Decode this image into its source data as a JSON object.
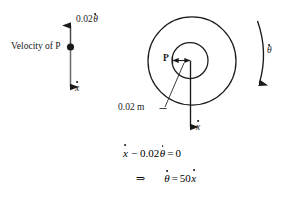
{
  "figure": {
    "kind": "kinematics-diagram",
    "background_color": "#ffffff",
    "ink_color": "#1a1a1a"
  },
  "left_panel": {
    "caption": "Velocity of P",
    "top_label": {
      "coefficient": "0.02",
      "variable": "θ",
      "accent": "dot"
    },
    "bottom_label": {
      "variable": "x",
      "accent": "dot"
    },
    "point_marker": "filled-dot"
  },
  "right_panel": {
    "point_label": "P",
    "radius_label": "0.02 m",
    "angular_label": {
      "variable": "θ",
      "accent": "dot"
    },
    "linear_label": {
      "variable": "x",
      "accent": "dot"
    },
    "circles": [
      {
        "name": "outer-circle",
        "cx": 192,
        "cy": 61,
        "r": 44
      },
      {
        "name": "inner-circle",
        "cx": 190,
        "cy": 60.5,
        "r": 18
      }
    ]
  },
  "equations": {
    "line1": {
      "terms": [
        "x",
        "−",
        "0.02",
        "θ",
        "=",
        "0"
      ],
      "display": "ẋ − 0.02θ̇ = 0"
    },
    "line2": {
      "implies": "⇒",
      "terms": [
        "θ",
        "=",
        "50",
        "x"
      ],
      "display": "θ̇ = 50ẋ"
    }
  }
}
